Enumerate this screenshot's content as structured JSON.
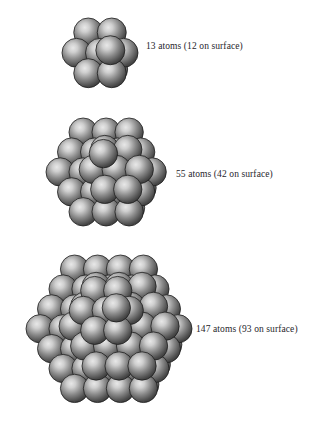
{
  "figure": {
    "background_color": "#ffffff",
    "width": 324,
    "height": 435,
    "sphere_colors": {
      "highlight": "#e8e8e8",
      "mid": "#8a8a8a",
      "shadow": "#2e2e2e",
      "outline": "#1c1c1c",
      "back_layer": "#9a9a9a"
    },
    "text_color": "#26262b"
  },
  "clusters": [
    {
      "id": "cluster-13",
      "label": "13 atoms (12 on surface)",
      "atom_count": 13,
      "surface_atoms": 12,
      "shell": 1,
      "geometry": "icosahedral",
      "label_x": 146,
      "label_y": 41,
      "box": {
        "x": 62,
        "y": 18,
        "w": 76,
        "h": 70
      },
      "sphere_radius": 15.0
    },
    {
      "id": "cluster-55",
      "label": "55 atoms (42 on surface)",
      "atom_count": 55,
      "surface_atoms": 42,
      "shell": 2,
      "geometry": "icosahedral",
      "label_x": 176,
      "label_y": 169,
      "box": {
        "x": 46,
        "y": 118,
        "w": 122,
        "h": 108
      },
      "sphere_radius": 12.6
    },
    {
      "id": "cluster-147",
      "label": "147 atoms (93 on surface)",
      "atom_count": 147,
      "surface_atoms": 93,
      "shell": 3,
      "geometry": "icosahedral",
      "label_x": 196,
      "label_y": 324,
      "box": {
        "x": 26,
        "y": 255,
        "w": 166,
        "h": 165
      },
      "sphere_radius": 12.1
    }
  ],
  "chart_data": {
    "type": "diagram",
    "title": "",
    "categories": [
      "13 atoms",
      "55 atoms",
      "147 atoms"
    ],
    "series": [
      {
        "name": "total atoms",
        "values": [
          13,
          55,
          147
        ]
      },
      {
        "name": "atoms on surface",
        "values": [
          12,
          42,
          93
        ]
      }
    ],
    "annotations": [
      "13 atoms (12 on surface)",
      "55 atoms (42 on surface)",
      "147 atoms (93 on surface)"
    ],
    "xlabel": "",
    "ylabel": "",
    "grid": false,
    "legend": "none"
  }
}
